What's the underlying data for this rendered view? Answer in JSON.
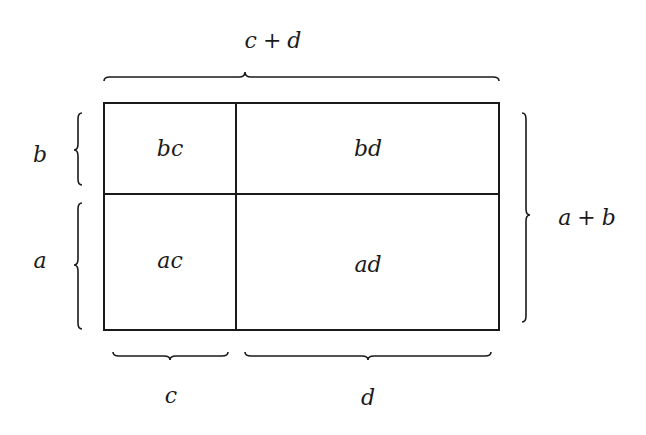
{
  "diagram": {
    "cells": [
      {
        "id": "bc",
        "label": "bc",
        "row": "top",
        "col": "left"
      },
      {
        "id": "bd",
        "label": "bd",
        "row": "top",
        "col": "right"
      },
      {
        "id": "ac",
        "label": "ac",
        "row": "bottom",
        "col": "left"
      },
      {
        "id": "ad",
        "label": "ad",
        "row": "bottom",
        "col": "right"
      }
    ],
    "labels": {
      "top_total": {
        "v1": "c",
        "op": "+",
        "v2": "d"
      },
      "right_total": {
        "v1": "a",
        "op": "+",
        "v2": "b"
      },
      "left_top": "b",
      "left_bottom": "a",
      "bottom_left": "c",
      "bottom_right": "d"
    },
    "colors": {
      "line": "#1a1a1a",
      "background": "#ffffff"
    }
  }
}
